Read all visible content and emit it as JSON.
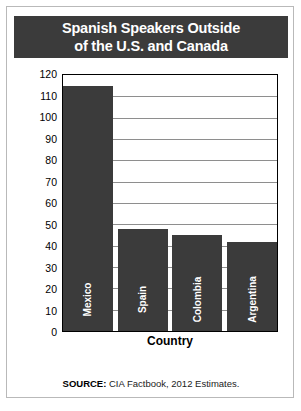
{
  "card": {
    "title_lines": [
      "Spanish Speakers Outside",
      "of the U.S. and Canada"
    ],
    "source_prefix": "SOURCE:",
    "source_text": " CIA Factbook, 2012 Estimates."
  },
  "colors": {
    "banner": "#3b3b3b",
    "bar": "#3b3b3b",
    "gridline": "#8e8e8e",
    "plot_border": "#000000",
    "card_border": "#b9b9b9",
    "background": "#ffffff",
    "bar_label": "#ffffff"
  },
  "chart_data": {
    "type": "bar",
    "title": "Spanish Speakers Outside of the U.S. and Canada",
    "categories": [
      "Mexico",
      "Spain",
      "Colombia",
      "Argentina"
    ],
    "values": [
      115,
      48,
      45,
      41.5
    ],
    "xlabel": "Country",
    "ylabel": "Speakers of Spanish (millions)",
    "ylim": [
      0,
      120
    ],
    "ytick_step": 10,
    "yticks": [
      0,
      10,
      20,
      30,
      40,
      50,
      60,
      70,
      80,
      90,
      100,
      110,
      120
    ],
    "ytick_labels": [
      "0",
      "10",
      "20",
      "30",
      "40",
      "50",
      "60",
      "70",
      "80",
      "90",
      "100",
      "110",
      "120"
    ],
    "grid": true,
    "grid_axis": "y",
    "legend": false,
    "source": "SOURCE: CIA Factbook, 2012 Estimates."
  }
}
